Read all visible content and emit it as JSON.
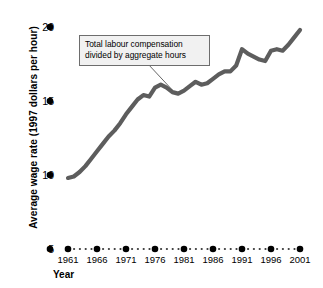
{
  "chart_data": {
    "type": "line",
    "title": "",
    "xlabel": "Year",
    "ylabel": "Average wage rate (1997 dollars per hour)",
    "xlim": [
      1960,
      2002
    ],
    "ylim": [
      5,
      20
    ],
    "grid": false,
    "legend": null,
    "series_name": "Average wage rate",
    "series_color": "#5d5d5d",
    "x_tick_labels": [
      "1961",
      "1966",
      "1971",
      "1976",
      "1981",
      "1986",
      "1991",
      "1996",
      "2001"
    ],
    "x_tick_values": [
      1961,
      1966,
      1971,
      1976,
      1981,
      1986,
      1991,
      1996,
      2001
    ],
    "y_tick_labels": [
      "5",
      "10",
      "15",
      "20"
    ],
    "y_tick_values": [
      5,
      10,
      15,
      20
    ],
    "x": [
      1961,
      1962,
      1963,
      1964,
      1965,
      1966,
      1967,
      1968,
      1969,
      1970,
      1971,
      1972,
      1973,
      1974,
      1975,
      1976,
      1977,
      1978,
      1979,
      1980,
      1981,
      1982,
      1983,
      1984,
      1985,
      1986,
      1987,
      1988,
      1989,
      1990,
      1991,
      1992,
      1993,
      1994,
      1995,
      1996,
      1997,
      1998,
      1999,
      2000,
      2001
    ],
    "values": [
      9.8,
      9.9,
      10.2,
      10.6,
      11.1,
      11.6,
      12.1,
      12.6,
      13.0,
      13.5,
      14.1,
      14.6,
      15.1,
      15.4,
      15.3,
      15.9,
      16.1,
      15.9,
      15.6,
      15.5,
      15.7,
      16.0,
      16.3,
      16.1,
      16.2,
      16.5,
      16.8,
      17.0,
      17.0,
      17.4,
      18.5,
      18.2,
      18.0,
      17.8,
      17.7,
      18.4,
      18.5,
      18.4,
      18.8,
      19.3,
      19.8
    ],
    "annotations": [
      {
        "name": "series-callout",
        "line1": "Total labour compensation",
        "line2": "divided by aggregate hours",
        "points_to_year": 1979
      }
    ],
    "axis_marker_style": "dotted-with-dots",
    "axis_marker_color": "#000000"
  }
}
